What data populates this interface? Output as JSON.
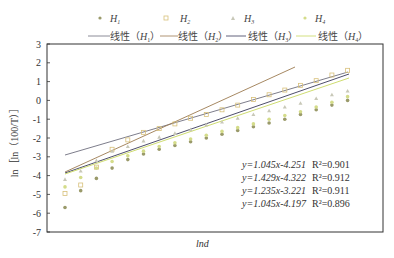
{
  "chart_data": {
    "type": "scatter",
    "title": "",
    "xlabel": "lnd",
    "ylabel": "ln［ln（100/T）］",
    "ylim": [
      -7,
      3
    ],
    "yticks": [
      3,
      2,
      1,
      0,
      -1,
      -2,
      -3,
      -4,
      -5,
      -6,
      -7
    ],
    "xticks": [],
    "grid": false,
    "legend_position": "top",
    "legend": {
      "markers": [
        "H1",
        "H2",
        "H3",
        "H4"
      ],
      "lines": [
        "线性（H1）",
        "线性（H2）",
        "线性（H3）",
        "线性（H4）"
      ]
    },
    "x_index": [
      1,
      2,
      3,
      4,
      5,
      6,
      7,
      8,
      9,
      10,
      11,
      12,
      13,
      14,
      15,
      16,
      17,
      18,
      19
    ],
    "series": [
      {
        "name": "H1",
        "marker": "circle",
        "color": "#9a9a6a",
        "values": [
          -5.7,
          -4.8,
          -4.15,
          -3.6,
          -3.15,
          -2.85,
          -2.6,
          -2.4,
          -2.2,
          -2.0,
          -1.8,
          -1.6,
          -1.4,
          -1.2,
          -1.0,
          -0.75,
          -0.5,
          -0.25,
          0.0
        ]
      },
      {
        "name": "H2",
        "marker": "square",
        "color": "#d8c07a",
        "values": [
          -4.95,
          -4.5,
          -3.55,
          -2.6,
          -2.1,
          -1.7,
          -1.5,
          -1.25,
          -0.95,
          -0.75,
          -0.5,
          -0.25,
          0.05,
          0.3,
          0.55,
          0.8,
          1.05,
          1.35,
          1.6
        ]
      },
      {
        "name": "H3",
        "marker": "triangle",
        "color": "#c8c8b8",
        "values": [
          -4.2,
          -3.75,
          -3.2,
          -2.7,
          -2.45,
          -2.15,
          -1.95,
          -1.75,
          -1.55,
          -1.3,
          -1.15,
          -0.95,
          -0.75,
          -0.55,
          -0.35,
          -0.15,
          0.1,
          0.3,
          0.5
        ]
      },
      {
        "name": "H4",
        "marker": "circle",
        "color": "#d4dc8a",
        "values": [
          -4.6,
          -4.1,
          -3.6,
          -3.25,
          -2.95,
          -2.7,
          -2.45,
          -2.25,
          -2.05,
          -1.85,
          -1.65,
          -1.45,
          -1.25,
          -1.0,
          -0.8,
          -0.6,
          -0.35,
          -0.1,
          0.2
        ]
      }
    ],
    "fits": [
      {
        "name": "线性（H1）",
        "equation": "y=1.045x-4.251",
        "r2": "R²=0.901",
        "color": "#6e6e7e"
      },
      {
        "name": "线性（H2）",
        "equation": "y=1.429x-4.322",
        "r2": "R²=0.912",
        "color": "#9c7a50"
      },
      {
        "name": "线性（H3）",
        "equation": "y=1.235x-3.221",
        "r2": "R²=0.911",
        "color": "#3a3a5a"
      },
      {
        "name": "线性（H4）",
        "equation": "y=1.045x-4.197",
        "r2": "R²=0.896",
        "color": "#c8d860"
      }
    ]
  },
  "labels": {
    "legend_h1": "H",
    "legend_h2": "H",
    "legend_h3": "H",
    "legend_h4": "H",
    "sub1": "1",
    "sub2": "2",
    "sub3": "3",
    "sub4": "4",
    "linear": "线性（",
    "close": "）",
    "xlabel": "lnd",
    "eq1": "y=1.045x-4.251",
    "eq2": "y=1.429x-4.322",
    "eq3": "y=1.235x-3.221",
    "eq4": "y=1.045x-4.197",
    "r1": "R²=0.901",
    "r2": "R²=0.912",
    "r3": "R²=0.911",
    "r4": "R²=0.896"
  }
}
